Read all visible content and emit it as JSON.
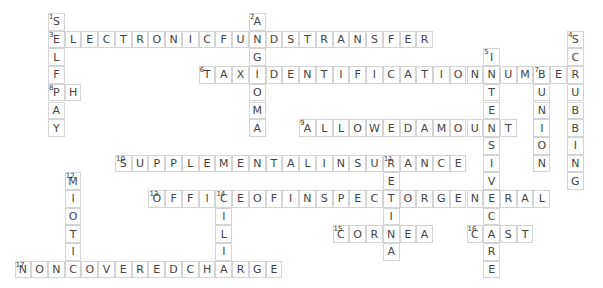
{
  "puzzle": {
    "grid": {
      "origin_x": 48,
      "origin_y": 13,
      "cell_w": 16.74,
      "cell_h": 17.7
    },
    "entries": [
      {
        "number": 1,
        "direction": "down",
        "answer": "SELFPAY",
        "row": 0,
        "col": 0
      },
      {
        "number": 2,
        "direction": "down",
        "answer": "ANGIOMA",
        "row": 0,
        "col": 12
      },
      {
        "number": 3,
        "direction": "across",
        "answer": "ELECTRONICFUNDSTRANSFER",
        "row": 1,
        "col": 0
      },
      {
        "number": 4,
        "direction": "down",
        "answer": "SCRUBBING",
        "row": 1,
        "col": 31
      },
      {
        "number": 5,
        "direction": "down",
        "answer": "INTENSIVECARE",
        "row": 2,
        "col": 26
      },
      {
        "number": 6,
        "direction": "across",
        "answer": "TAXIDENTIFICATIONNUMBER",
        "row": 3,
        "col": 9
      },
      {
        "number": 7,
        "direction": "down",
        "answer": "BUNION",
        "row": 3,
        "col": 29
      },
      {
        "number": 8,
        "direction": "across",
        "answer": "PH",
        "row": 4,
        "col": 0
      },
      {
        "number": 9,
        "direction": "across",
        "answer": "ALLOWEDAMOUNT",
        "row": 6,
        "col": 15
      },
      {
        "number": 10,
        "direction": "across",
        "answer": "SUPPLEMENTALINSURANCE",
        "row": 8,
        "col": 4
      },
      {
        "number": 11,
        "direction": "down",
        "answer": "RETINA",
        "row": 8,
        "col": 20
      },
      {
        "number": 12,
        "direction": "down",
        "answer": "MIOTIC",
        "row": 9,
        "col": 1
      },
      {
        "number": 13,
        "direction": "across",
        "answer": "OFFICEOFINSPECTORGENERAL",
        "row": 10,
        "col": 6
      },
      {
        "number": 14,
        "direction": "down",
        "answer": "CILIA",
        "row": 10,
        "col": 10
      },
      {
        "number": 15,
        "direction": "across",
        "answer": "CORNEA",
        "row": 12,
        "col": 17
      },
      {
        "number": 16,
        "direction": "across",
        "answer": "CAST",
        "row": 12,
        "col": 25
      },
      {
        "number": 17,
        "direction": "across",
        "answer": "NONCOVEREDCHARGE",
        "row": 14,
        "col": -2
      }
    ]
  }
}
